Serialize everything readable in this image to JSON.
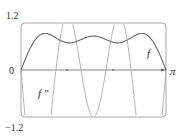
{
  "chart_data": {
    "type": "line",
    "title": "",
    "xlabel": "",
    "ylabel": "",
    "xlim": [
      0,
      3.14159
    ],
    "ylim": [
      -1.2,
      1.2
    ],
    "grid": false,
    "legend": "inline labels",
    "x_tick_labels": [
      "0",
      "π"
    ],
    "y_tick_labels": [
      "1.2",
      "-1.2"
    ],
    "y_labels_display": {
      "top": "1.2",
      "bottom": "−1.2",
      "origin": "0",
      "right": "π"
    },
    "series": [
      {
        "name": "f",
        "label": "f",
        "description": "f(x) = sin x + (1/3) sin 3x + (1/5) sin 5x",
        "x": [
          0,
          0.39,
          0.79,
          1.18,
          1.57,
          1.96,
          2.36,
          2.75,
          3.14
        ],
        "values": [
          0,
          0.76,
          0.84,
          0.8,
          0.87,
          0.8,
          0.84,
          0.76,
          0
        ]
      },
      {
        "name": "f''",
        "label": "f ″",
        "description": "f''(x) = -sin x - 3 sin 3x - 5 sin 5x (clipped to window)",
        "x": [
          0,
          0.39,
          0.79,
          1.18,
          1.57,
          1.96,
          2.36,
          2.75,
          3.14
        ],
        "values": [
          0,
          -8.0,
          0.1,
          1.0,
          -1.0,
          1.0,
          0.1,
          -8.0,
          0
        ]
      }
    ],
    "colors": {
      "frame": "#9a9a9a",
      "axis": "#555555",
      "f": "#666666",
      "fpp": "#b0b0b0"
    }
  },
  "labels": {
    "y_top": "1.2",
    "y_bottom": "−1.2",
    "origin": "0",
    "x_end": "π",
    "f": "f",
    "fpp": "f ″"
  }
}
